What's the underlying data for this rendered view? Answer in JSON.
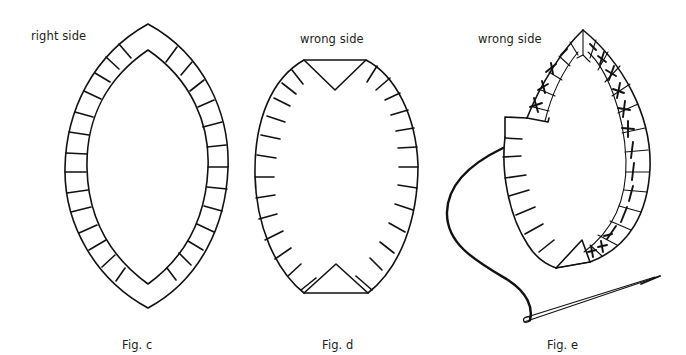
{
  "figures": [
    {
      "id": "fig-c",
      "caption": "Fig. c",
      "side_label": "right side",
      "depicts": "Almond-shaped fabric patch with seam allowance border and clip marks, right side facing"
    },
    {
      "id": "fig-d",
      "caption": "Fig. d",
      "side_label": "wrong side",
      "depicts": "Patch with clipped seam allowance and points folded, wrong side facing"
    },
    {
      "id": "fig-e",
      "caption": "Fig. e",
      "side_label": "wrong side",
      "depicts": "Seam allowance being turned under and basted around the patch with needle and thread"
    }
  ],
  "colors": {
    "ink": "#111111",
    "background": "#ffffff",
    "text": "#222222"
  }
}
